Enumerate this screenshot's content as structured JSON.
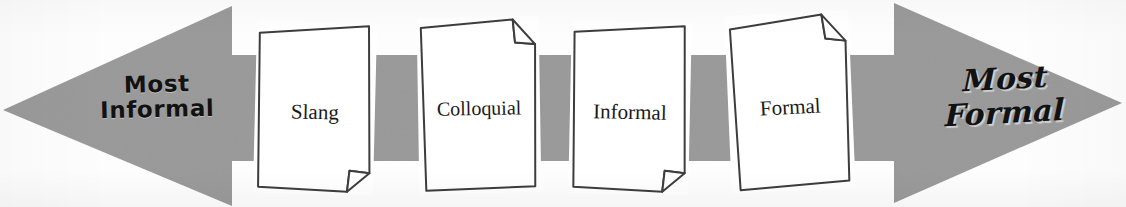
{
  "diagram": {
    "arrow": {
      "name": "double-headed-formality-arrow",
      "fill_color": "#9b9b9b",
      "direction": "bidirectional",
      "left_tip_x": 3,
      "right_tip_x": 1122,
      "body_top_y": 55,
      "body_bottom_y": 161
    },
    "left_label": {
      "line1": "Most",
      "line2": "Informal",
      "style": "handwritten",
      "color": "#121212"
    },
    "right_label": {
      "line1": "Most",
      "line2": "Formal",
      "style": "italic-script-serif",
      "color": "#121212"
    },
    "cards": [
      {
        "id": "slang",
        "label": "Slang",
        "fold": "bottom-right",
        "order": 1
      },
      {
        "id": "colloquial",
        "label": "Colloquial",
        "fold": "top-right",
        "order": 2
      },
      {
        "id": "informal",
        "label": "Informal",
        "fold": "bottom-right",
        "order": 3
      },
      {
        "id": "formal",
        "label": "Formal",
        "fold": "top-right",
        "order": 4
      }
    ],
    "colors": {
      "arrow": "#9b9b9b",
      "card_fill": "#ffffff",
      "card_stroke": "#3d3d3d",
      "background": "#fdfdfd",
      "text": "#1a1a1a"
    }
  }
}
